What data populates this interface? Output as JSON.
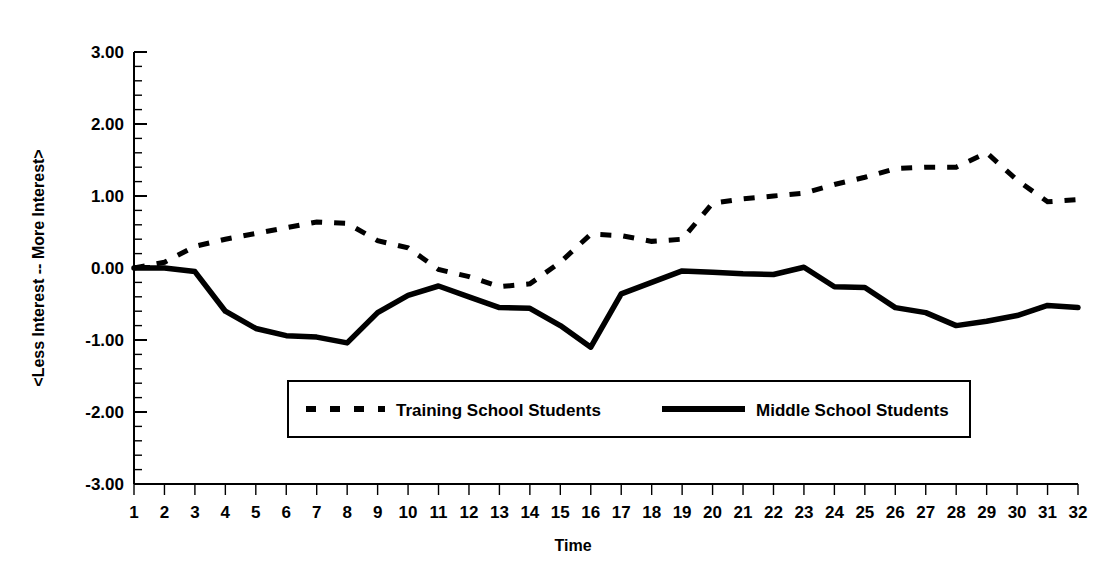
{
  "chart_data": {
    "type": "line",
    "title": "",
    "xlabel": "Time",
    "ylabel": "<Less Interest  --  More Interest>",
    "x": [
      1,
      2,
      3,
      4,
      5,
      6,
      7,
      8,
      9,
      10,
      11,
      12,
      13,
      14,
      15,
      16,
      17,
      18,
      19,
      20,
      21,
      22,
      23,
      24,
      25,
      26,
      27,
      28,
      29,
      30,
      31,
      32
    ],
    "xtick_labels": [
      "1",
      "2",
      "3",
      "4",
      "5",
      "6",
      "7",
      "8",
      "9",
      "10",
      "11",
      "12",
      "13",
      "14",
      "15",
      "16",
      "17",
      "18",
      "19",
      "20",
      "21",
      "22",
      "23",
      "24",
      "25",
      "26",
      "27",
      "28",
      "29",
      "30",
      "31",
      "32"
    ],
    "ytick_labels": [
      "3.00",
      "2.00",
      "1.00",
      "0.00",
      "-1.00",
      "-2.00",
      "-3.00"
    ],
    "ytick_values": [
      3.0,
      2.0,
      1.0,
      0.0,
      -1.0,
      -2.0,
      -3.0
    ],
    "ylim": [
      -3.0,
      3.0
    ],
    "xlim": [
      1,
      32
    ],
    "grid": false,
    "minor_ticks_per_interval": 4,
    "legend_position": "inside-lower-center",
    "series": [
      {
        "name": "Training School Students",
        "style": "dashed",
        "values": [
          0.0,
          0.08,
          0.3,
          0.4,
          0.48,
          0.56,
          0.64,
          0.62,
          0.38,
          0.28,
          -0.02,
          -0.12,
          -0.26,
          -0.22,
          0.08,
          0.47,
          0.45,
          0.37,
          0.4,
          0.9,
          0.96,
          1.0,
          1.04,
          1.16,
          1.26,
          1.38,
          1.4,
          1.4,
          1.6,
          1.22,
          0.92,
          0.95
        ]
      },
      {
        "name": "Middle School Students",
        "style": "solid",
        "values": [
          0.0,
          0.0,
          -0.05,
          -0.6,
          -0.84,
          -0.94,
          -0.96,
          -1.04,
          -0.62,
          -0.38,
          -0.25,
          -0.4,
          -0.55,
          -0.56,
          -0.8,
          -1.1,
          -0.36,
          -0.2,
          -0.04,
          -0.06,
          -0.08,
          -0.09,
          0.01,
          -0.26,
          -0.27,
          -0.55,
          -0.62,
          -0.8,
          -0.74,
          -0.66,
          -0.52,
          -0.55
        ]
      }
    ]
  },
  "axis": {
    "y_title": "<Less Interest  --  More Interest>",
    "x_title": "Time"
  },
  "legend": {
    "items": [
      {
        "label": "Training School Students",
        "style": "dashed"
      },
      {
        "label": "Middle School Students",
        "style": "solid"
      }
    ]
  }
}
